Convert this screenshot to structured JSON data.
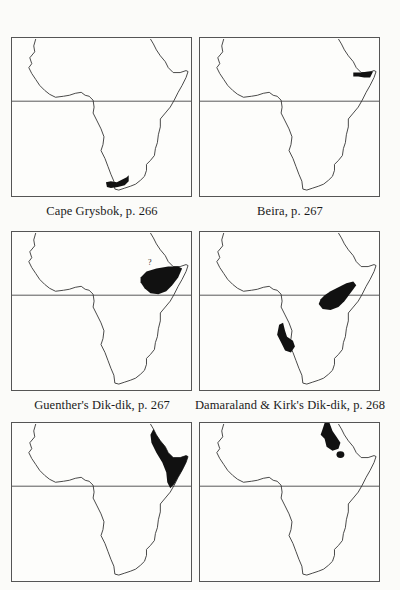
{
  "maps": [
    {
      "id": "cape-grysbok",
      "caption": "Cape Grysbok, p. 266",
      "region": "southern tip of South Africa (Cape)"
    },
    {
      "id": "beira",
      "caption": "Beira, p. 267",
      "region": "northern Somalia / Horn of Africa"
    },
    {
      "id": "guenthers-dik-dik",
      "caption": "Guenther's Dik-dik, p. 267",
      "region": "Somalia, Ethiopia, northern Kenya",
      "annotation": "?"
    },
    {
      "id": "damaraland-kirks-dik-dik",
      "caption": "Damaraland & Kirk's Dik-dik, p. 268",
      "region": "East Africa (Kenya/Tanzania) and Namibia/Angola"
    },
    {
      "id": "map-5",
      "caption": "",
      "region": "Horn of Africa, Eritrea to Somalia"
    },
    {
      "id": "map-6",
      "caption": "",
      "region": "Sudan / Red Sea coast, Eritrea"
    }
  ],
  "colors": {
    "outline": "#333333",
    "range_fill": "#111111",
    "background": "#fbfbf9"
  }
}
